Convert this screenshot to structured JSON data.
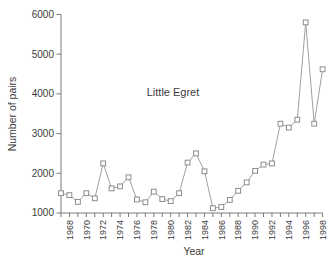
{
  "figure": {
    "background": "#ffffff"
  },
  "chart_data": {
    "type": "line",
    "title": "",
    "annotation": "Little Egret",
    "xlabel": "Year",
    "ylabel": "Number of pairs",
    "x": [
      1967,
      1968,
      1969,
      1970,
      1971,
      1972,
      1973,
      1974,
      1975,
      1976,
      1977,
      1978,
      1979,
      1980,
      1981,
      1982,
      1983,
      1984,
      1985,
      1986,
      1987,
      1988,
      1989,
      1990,
      1991,
      1992,
      1993,
      1994,
      1995,
      1996,
      1997,
      1998
    ],
    "values": [
      1500,
      1450,
      1280,
      1500,
      1370,
      2250,
      1620,
      1670,
      1900,
      1340,
      1270,
      1540,
      1350,
      1300,
      1500,
      2270,
      2500,
      2050,
      1120,
      1150,
      1330,
      1560,
      1770,
      2060,
      2220,
      2250,
      3250,
      3150,
      3350,
      5800,
      3250,
      4620
    ],
    "ylim": [
      1000,
      6000
    ],
    "yticks": [
      1000,
      2000,
      3000,
      4000,
      5000,
      6000
    ],
    "ytick_labels": [
      "1000",
      "2000",
      "3000",
      "4000",
      "5000",
      "6000"
    ],
    "xtick_labels": [
      "1968",
      "1970",
      "1972",
      "1974",
      "1976",
      "1978",
      "1980",
      "1982",
      "1984",
      "1986",
      "1988",
      "1990",
      "1992",
      "1994",
      "1996",
      "1998"
    ],
    "xtick_label_rotation_deg": 90,
    "minor_xticks_every_year": true,
    "grid": false,
    "legend": "none",
    "marker": "open-square",
    "colors": {
      "line": "#a0a0a0",
      "marker_fill": "#ffffff",
      "marker_stroke": "#8c8c8c",
      "axis": "#7a7a7a",
      "text": "#3c3c3c"
    }
  }
}
